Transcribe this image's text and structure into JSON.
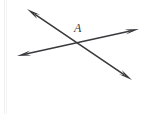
{
  "figure": {
    "kind": "geometry-diagram",
    "background_color": "#ffffff",
    "stroke_color": "#3a3a3e",
    "canvas": {
      "width": 151,
      "height": 114
    },
    "labels": [
      {
        "id": "point-a",
        "text": "A",
        "x": 74,
        "y": 22,
        "style": "italic-serif",
        "color": "#38383c",
        "font_size": 12
      }
    ],
    "lines": [
      {
        "id": "line-descending",
        "name": "line-upper-left-to-lower-right",
        "x1": 27,
        "y1": 9,
        "x2": 132,
        "y2": 80,
        "stroke_width": 1.6,
        "arrow_start": true,
        "arrow_end": true
      },
      {
        "id": "line-ascending",
        "name": "line-lower-left-to-upper-right",
        "x1": 17,
        "y1": 56,
        "x2": 139,
        "y2": 29,
        "stroke_width": 1.6,
        "arrow_start": true,
        "arrow_end": true
      }
    ],
    "intersection": {
      "x": 78,
      "y": 42,
      "label": "A"
    },
    "arrowheads": [
      {
        "id": "arrow-upper-left",
        "tip_x": 27,
        "tip_y": 9
      },
      {
        "id": "arrow-lower-right",
        "tip_x": 132,
        "tip_y": 80
      },
      {
        "id": "arrow-lower-left",
        "tip_x": 17,
        "tip_y": 56
      },
      {
        "id": "arrow-upper-right",
        "tip_x": 139,
        "tip_y": 29
      }
    ],
    "artifacts": [
      {
        "id": "scan-edge-left",
        "x": 4,
        "color": "#f0f0f2"
      },
      {
        "id": "scan-edge-left-2",
        "x": 6,
        "color": "#f4f4f6"
      }
    ]
  }
}
